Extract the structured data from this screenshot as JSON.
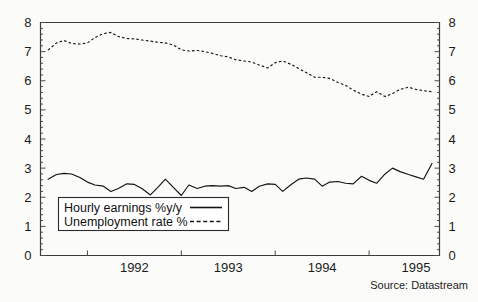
{
  "chart_data": {
    "type": "line",
    "title": "",
    "subtitle": "",
    "xlabel": "",
    "ylabel": "",
    "ylim": [
      0,
      8
    ],
    "xlim": [
      1991.5,
      1995.75
    ],
    "grid": false,
    "legend_position": "inside-bottom-left",
    "y_ticks": [
      "8",
      "7",
      "6",
      "5",
      "4",
      "3",
      "2",
      "1",
      "0"
    ],
    "y_tick_values": [
      8,
      7,
      6,
      5,
      4,
      3,
      2,
      1,
      0
    ],
    "y_ticks_right": [
      "8",
      "7",
      "6",
      "5",
      "4",
      "3",
      "2",
      "1",
      "0"
    ],
    "x_ticks": [
      "1992",
      "1993",
      "1994",
      "1995"
    ],
    "x_tick_values": [
      1992,
      1993,
      1994,
      1995
    ],
    "source": "Source: Datastream",
    "series": [
      {
        "name": "Hourly earnings %y/y",
        "style": "solid",
        "color": "#141414",
        "x": [
          1991.58,
          1991.67,
          1991.75,
          1991.83,
          1991.92,
          1992.0,
          1992.08,
          1992.17,
          1992.25,
          1992.33,
          1992.42,
          1992.5,
          1992.58,
          1992.67,
          1992.75,
          1992.83,
          1992.92,
          1993.0,
          1993.08,
          1993.17,
          1993.25,
          1993.33,
          1993.42,
          1993.5,
          1993.58,
          1993.67,
          1993.75,
          1993.83,
          1993.92,
          1994.0,
          1994.08,
          1994.17,
          1994.25,
          1994.33,
          1994.42,
          1994.5,
          1994.58,
          1994.67,
          1994.75,
          1994.83,
          1994.92,
          1995.0,
          1995.08,
          1995.17,
          1995.25,
          1995.33,
          1995.42,
          1995.5,
          1995.58,
          1995.67
        ],
        "values": [
          2.62,
          2.78,
          2.82,
          2.8,
          2.68,
          2.52,
          2.42,
          2.38,
          2.2,
          2.3,
          2.46,
          2.44,
          2.3,
          2.08,
          2.34,
          2.62,
          2.32,
          2.06,
          2.42,
          2.3,
          2.38,
          2.4,
          2.38,
          2.4,
          2.3,
          2.34,
          2.2,
          2.38,
          2.46,
          2.44,
          2.2,
          2.44,
          2.62,
          2.66,
          2.62,
          2.38,
          2.52,
          2.54,
          2.48,
          2.46,
          2.72,
          2.58,
          2.48,
          2.8,
          3.0,
          2.88,
          2.78,
          2.7,
          2.62,
          3.16
        ]
      },
      {
        "name": "Unemployment rate %",
        "style": "dashed",
        "color": "#141414",
        "x": [
          1991.58,
          1991.67,
          1991.75,
          1991.83,
          1991.92,
          1992.0,
          1992.08,
          1992.17,
          1992.25,
          1992.33,
          1992.42,
          1992.5,
          1992.58,
          1992.67,
          1992.75,
          1992.83,
          1992.92,
          1993.0,
          1993.08,
          1993.17,
          1993.25,
          1993.33,
          1993.42,
          1993.5,
          1993.58,
          1993.67,
          1993.75,
          1993.83,
          1993.92,
          1994.0,
          1994.08,
          1994.17,
          1994.25,
          1994.33,
          1994.42,
          1994.5,
          1994.58,
          1994.67,
          1994.75,
          1994.83,
          1994.92,
          1995.0,
          1995.08,
          1995.17,
          1995.25,
          1995.33,
          1995.42,
          1995.5,
          1995.58,
          1995.67
        ],
        "values": [
          7.05,
          7.3,
          7.38,
          7.28,
          7.26,
          7.3,
          7.48,
          7.62,
          7.66,
          7.52,
          7.45,
          7.44,
          7.4,
          7.36,
          7.32,
          7.3,
          7.22,
          7.06,
          7.02,
          7.04,
          7.0,
          6.94,
          6.86,
          6.82,
          6.72,
          6.68,
          6.64,
          6.54,
          6.44,
          6.62,
          6.68,
          6.56,
          6.42,
          6.28,
          6.12,
          6.12,
          6.08,
          5.94,
          5.84,
          5.68,
          5.54,
          5.46,
          5.62,
          5.46,
          5.56,
          5.7,
          5.78,
          5.7,
          5.66,
          5.62
        ]
      }
    ],
    "annotations": []
  },
  "legend": {
    "entries": [
      {
        "label": "Hourly earnings %y/y",
        "style": "solid"
      },
      {
        "label": "Unemployment rate %",
        "style": "dashed"
      }
    ]
  },
  "footer": {
    "source": "Source: Datastream"
  },
  "colors": {
    "ink": "#141414",
    "axis": "#3b3b3b",
    "background": "#fbfbfa"
  }
}
